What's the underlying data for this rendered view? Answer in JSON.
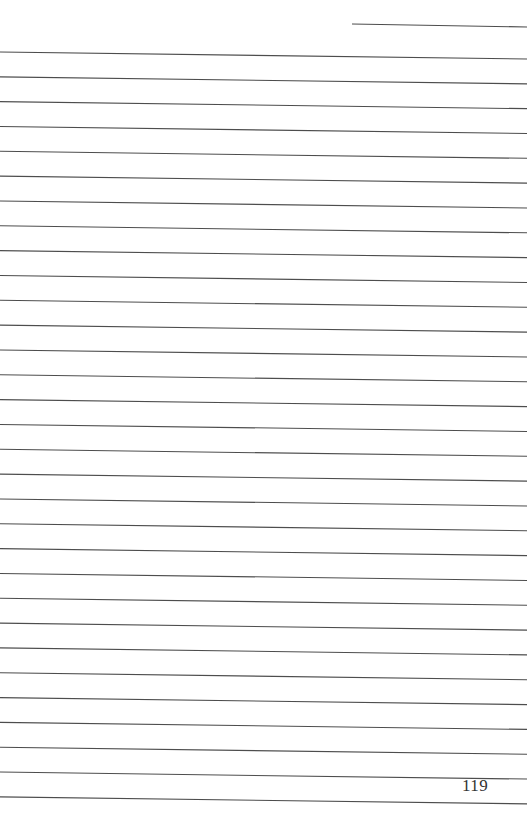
{
  "page": {
    "type": "lined-notebook-page",
    "background_color": "#ffffff",
    "line_color": "#4d4d4d",
    "page_number": "119"
  },
  "header_line": {
    "x1": 352,
    "y1": 24,
    "x2": 527,
    "y2": 27
  },
  "ruled_lines": {
    "count": 31,
    "x_start": 0,
    "x_end": 527,
    "first_left_y": 52,
    "spacing": 24.83,
    "right_drop": 7
  }
}
